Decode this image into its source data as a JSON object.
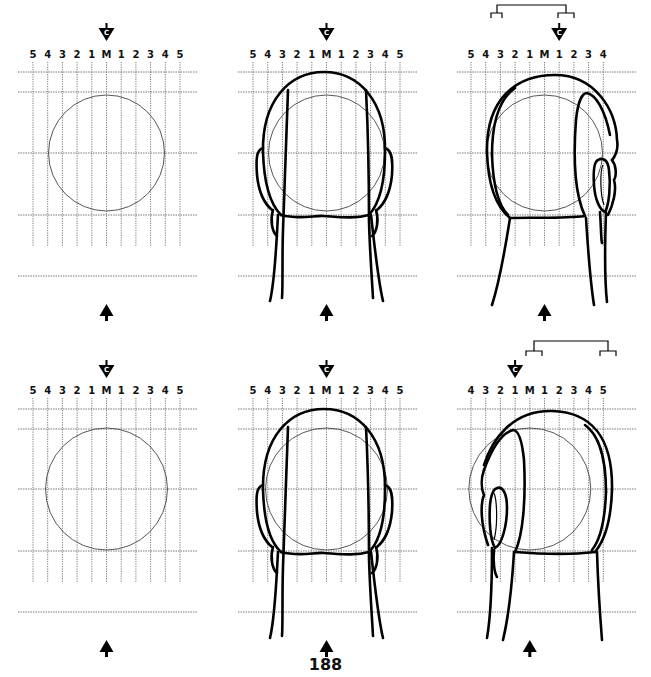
{
  "page": {
    "number": "188"
  },
  "grid_labels": {
    "full": [
      "5",
      "4",
      "3",
      "2",
      "1",
      "M",
      "1",
      "2",
      "3",
      "4",
      "5"
    ],
    "shift_right": [
      "5",
      "4",
      "3",
      "2",
      "1",
      "M",
      "1",
      "2",
      "3",
      "4"
    ],
    "shift_left": [
      "4",
      "3",
      "2",
      "1",
      "M",
      "1",
      "2",
      "3",
      "4",
      "5"
    ]
  },
  "center_marker": {
    "letter": "C",
    "icon": "center-marker-icon"
  },
  "panels": [
    {
      "id": "top-left",
      "row": 1,
      "col": 1,
      "content": "grid with circle",
      "labels": "full",
      "marker_at": "M"
    },
    {
      "id": "top-center",
      "row": 1,
      "col": 2,
      "content": "back of head, front view",
      "labels": "full",
      "marker_at": "M"
    },
    {
      "id": "top-right",
      "row": 1,
      "col": 3,
      "content": "back of head turned, ear on right",
      "labels": "shift_right",
      "marker_at": "1 (right)",
      "bracket": true
    },
    {
      "id": "bottom-left",
      "row": 2,
      "col": 1,
      "content": "grid with circle",
      "labels": "full",
      "marker_at": "M"
    },
    {
      "id": "bottom-center",
      "row": 2,
      "col": 2,
      "content": "back of head, front view",
      "labels": "full",
      "marker_at": "M"
    },
    {
      "id": "bottom-right",
      "row": 2,
      "col": 3,
      "content": "back of head turned, ear on left",
      "labels": "shift_left",
      "marker_at": "1 (left)",
      "bracket": true
    }
  ],
  "view_arrow": {
    "icon": "up-arrow-icon"
  }
}
